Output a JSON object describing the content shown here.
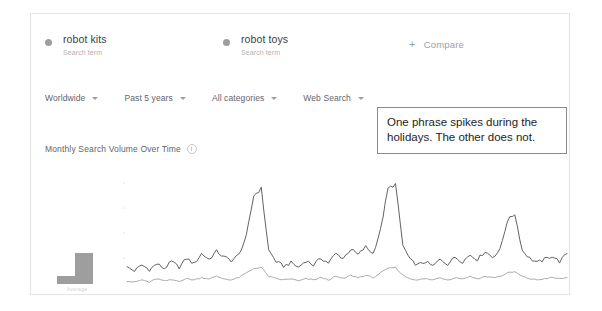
{
  "card": {
    "terms": [
      {
        "name": "robot kits",
        "sublabel": "Search term",
        "dot_color": "#9e9e9e"
      },
      {
        "name": "robot toys",
        "sublabel": "Search term",
        "dot_color": "#9e9e9e"
      }
    ],
    "compare": {
      "label": "Compare",
      "plus": "+"
    },
    "filters": [
      {
        "label": "Worldwide"
      },
      {
        "label": "Past 5 years"
      },
      {
        "label": "All categories"
      },
      {
        "label": "Web Search"
      }
    ],
    "chart_title": "Monthly Search Volume Over Time",
    "info_icon": "info-icon",
    "avg_label": "Average"
  },
  "annotation": {
    "text": "One phrase spikes during the holidays. The other does not.",
    "border_color": "#8a8a8a"
  },
  "chart_data": {
    "type": "line",
    "title": "Monthly Search Volume Over Time",
    "xlabel": "",
    "ylabel": "Search interest",
    "ylim": [
      0,
      100
    ],
    "grid": false,
    "legend_position": "top",
    "x": [
      "2015-01",
      "2015-02",
      "2015-03",
      "2015-04",
      "2015-05",
      "2015-06",
      "2015-07",
      "2015-08",
      "2015-09",
      "2015-10",
      "2015-11",
      "2015-12",
      "2016-01",
      "2016-02",
      "2016-03",
      "2016-04",
      "2016-05",
      "2016-06",
      "2016-07",
      "2016-08",
      "2016-09",
      "2016-10",
      "2016-11",
      "2016-12",
      "2017-01",
      "2017-02",
      "2017-03",
      "2017-04",
      "2017-05",
      "2017-06",
      "2017-07",
      "2017-08",
      "2017-09",
      "2017-10",
      "2017-11",
      "2017-12",
      "2018-01",
      "2018-02",
      "2018-03",
      "2018-04",
      "2018-05",
      "2018-06",
      "2018-07",
      "2018-08",
      "2018-09",
      "2018-10",
      "2018-11",
      "2018-12",
      "2019-01",
      "2019-02",
      "2019-03",
      "2019-04",
      "2019-05",
      "2019-06",
      "2019-07",
      "2019-08",
      "2019-09",
      "2019-10",
      "2019-11",
      "2019-12"
    ],
    "series": [
      {
        "name": "robot kits",
        "color": "#5f6368",
        "values": [
          19,
          16,
          21,
          17,
          22,
          18,
          24,
          19,
          27,
          22,
          31,
          26,
          33,
          28,
          25,
          30,
          46,
          82,
          88,
          34,
          24,
          20,
          23,
          19,
          25,
          21,
          27,
          23,
          31,
          27,
          35,
          30,
          37,
          31,
          52,
          88,
          92,
          38,
          25,
          21,
          24,
          20,
          26,
          22,
          28,
          24,
          30,
          26,
          33,
          28,
          34,
          60,
          66,
          34,
          27,
          23,
          26,
          29,
          24,
          31
        ]
      },
      {
        "name": "robot toys",
        "color": "#a8acb0",
        "values": [
          7,
          6,
          8,
          6,
          9,
          7,
          8,
          7,
          9,
          8,
          10,
          9,
          11,
          9,
          8,
          10,
          14,
          18,
          19,
          11,
          9,
          8,
          9,
          7,
          9,
          8,
          10,
          8,
          11,
          9,
          12,
          10,
          12,
          10,
          14,
          18,
          19,
          12,
          9,
          8,
          9,
          8,
          10,
          8,
          10,
          9,
          11,
          9,
          11,
          10,
          11,
          14,
          15,
          11,
          9,
          8,
          9,
          10,
          9,
          10
        ]
      }
    ],
    "annotations": [
      {
        "text": "One phrase spikes during the holidays. The other does not."
      }
    ]
  }
}
